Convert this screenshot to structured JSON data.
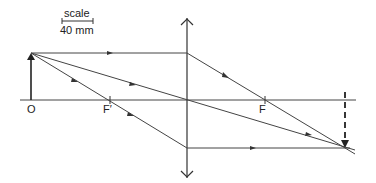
{
  "diagram": {
    "scale": {
      "label": "scale",
      "value": "40 mm"
    },
    "labels": {
      "object_point": "O",
      "focal_point_front": "F′",
      "focal_point_back": "F"
    },
    "elements": {
      "principal_axis": "horizontal line",
      "lens": "converging lens (double-headed vertical arrow)",
      "object": "upright arrow at O",
      "image": "inverted dashed arrow beyond F"
    },
    "rays": [
      {
        "name": "parallel-ray",
        "description": "parallel to axis, refracts through F"
      },
      {
        "name": "central-ray",
        "description": "through optical centre, undeviated"
      },
      {
        "name": "focal-ray",
        "description": "through F′, emerges parallel to axis"
      }
    ],
    "colors": {
      "ink": "#333333",
      "background": "#ffffff"
    }
  }
}
